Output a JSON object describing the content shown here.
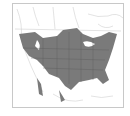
{
  "map": {
    "subject": "North America range map",
    "range_color": "#7a7a7a",
    "border_color": "#c8c8c8",
    "background": "#ffffff"
  }
}
